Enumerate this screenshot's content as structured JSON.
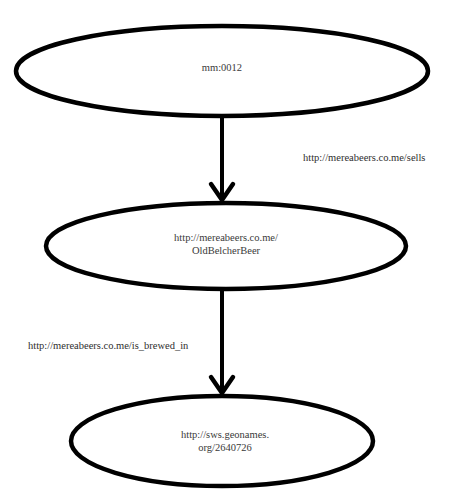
{
  "diagram": {
    "type": "rdf-graph",
    "colors": {
      "background": "#ffffff",
      "stroke": "#000000",
      "text": "#3a3a3a"
    },
    "nodes": [
      {
        "id": "n1",
        "lines": [
          "mm:0012"
        ],
        "cx": 222,
        "cy": 71,
        "rx": 206,
        "ry": 45
      },
      {
        "id": "n2",
        "lines": [
          "http://mereabeers.co.me/",
          "OldBelcherBeer"
        ],
        "cx": 226,
        "cy": 246,
        "rx": 180,
        "ry": 44
      },
      {
        "id": "n3",
        "lines": [
          "http://sws.geonames.",
          "org/2640726"
        ],
        "cx": 222,
        "cy": 441,
        "rx": 151,
        "ry": 45
      }
    ],
    "edges": [
      {
        "from": "n1",
        "to": "n2",
        "label": "http://mereabeers.co.me/sells"
      },
      {
        "from": "n2",
        "to": "n3",
        "label": "http://mereabeers.co.me/is_brewed_in"
      }
    ]
  }
}
